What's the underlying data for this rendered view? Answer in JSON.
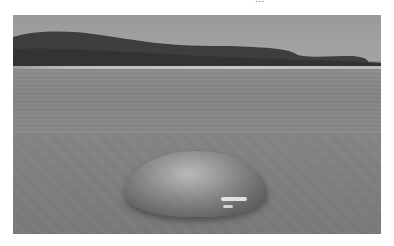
{
  "page": {
    "caption_fragment": "...",
    "background": "#ffffff"
  },
  "photo": {
    "subject": "jellyfish stranded on sandy beach",
    "style": "grayscale",
    "elements": [
      "sky",
      "headland",
      "shoreline",
      "water",
      "sand",
      "jellyfish"
    ],
    "colors": {
      "sky": "#a0a0a0",
      "headland": "#3c3c3c",
      "water": "#888888",
      "sand": "#808080"
    }
  }
}
